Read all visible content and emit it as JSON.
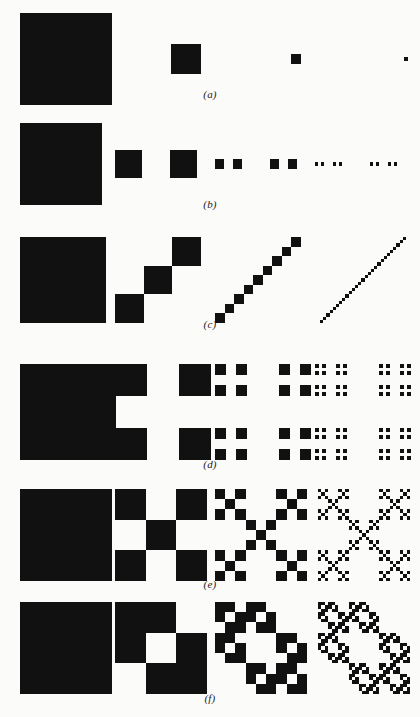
{
  "figure": {
    "background_color": "#fbfbfa",
    "ink_color": "#111111",
    "width": 420,
    "height": 717
  },
  "chart_data": {
    "type": "diagram",
    "title": "",
    "subtitle": "",
    "xlabel": "",
    "ylabel": "",
    "grid": false,
    "legend": null,
    "subdivision": 3,
    "iterations_shown": [
      0,
      1,
      2,
      3
    ],
    "rows": [
      {
        "caption": "(a)",
        "label": "a",
        "generator_name": "single-square",
        "pieces": 1,
        "scale": "1/3",
        "dimension": 0.0,
        "generator": [
          [
            0,
            0,
            0
          ],
          [
            0,
            1,
            0
          ],
          [
            0,
            0,
            0
          ]
        ],
        "piece_counts": [
          1,
          1,
          1,
          1
        ]
      },
      {
        "caption": "(b)",
        "label": "b",
        "generator_name": "cantor-dust-1d",
        "pieces": 2,
        "scale": "1/3",
        "dimension": 0.631,
        "generator": [
          [
            0,
            0,
            0
          ],
          [
            1,
            0,
            1
          ],
          [
            0,
            0,
            0
          ]
        ],
        "piece_counts": [
          1,
          2,
          4,
          8
        ]
      },
      {
        "caption": "(c)",
        "label": "c",
        "generator_name": "diagonal-line",
        "pieces": 3,
        "scale": "1/3",
        "dimension": 1.0,
        "generator": [
          [
            0,
            0,
            1
          ],
          [
            0,
            1,
            0
          ],
          [
            1,
            0,
            0
          ]
        ],
        "piece_counts": [
          1,
          3,
          9,
          27
        ]
      },
      {
        "caption": "(d)",
        "label": "d",
        "generator_name": "cantor-dust-2d",
        "pieces": 4,
        "scale": "1/3",
        "dimension": 1.262,
        "generator": [
          [
            1,
            0,
            1
          ],
          [
            0,
            0,
            0
          ],
          [
            1,
            0,
            1
          ]
        ],
        "piece_counts": [
          1,
          4,
          16,
          64
        ]
      },
      {
        "caption": "(e)",
        "label": "e",
        "generator_name": "vicsek-saltire",
        "pieces": 5,
        "scale": "1/3",
        "dimension": 1.465,
        "generator": [
          [
            1,
            0,
            1
          ],
          [
            0,
            1,
            0
          ],
          [
            1,
            0,
            1
          ]
        ],
        "piece_counts": [
          1,
          5,
          25,
          125
        ]
      },
      {
        "caption": "(f)",
        "label": "f",
        "generator_name": "offset-diagonal-blocks",
        "pieces": 8,
        "scale": "1/3",
        "dimension": 1.893,
        "generator": [
          [
            1,
            1,
            0
          ],
          [
            1,
            0,
            1
          ],
          [
            0,
            1,
            1
          ]
        ],
        "piece_counts": [
          1,
          8,
          64,
          512
        ]
      }
    ],
    "row_layout": [
      {
        "top": 13,
        "size": 92,
        "caption_top": 88,
        "columns": [
          20,
          140,
          250,
          360
        ]
      },
      {
        "top": 123,
        "size": 82,
        "caption_top": 198,
        "columns": [
          20,
          115,
          215,
          315
        ]
      },
      {
        "top": 237,
        "size": 86,
        "caption_top": 318,
        "columns": [
          20,
          115,
          215,
          320
        ]
      },
      {
        "top": 364,
        "size": 96,
        "caption_top": 458,
        "columns": [
          20,
          115,
          215,
          315
        ]
      },
      {
        "top": 489,
        "size": 92,
        "caption_top": 578,
        "columns": [
          20,
          115,
          215,
          318
        ]
      },
      {
        "top": 602,
        "size": 92,
        "caption_top": 692,
        "columns": [
          20,
          115,
          215,
          318
        ]
      }
    ]
  }
}
